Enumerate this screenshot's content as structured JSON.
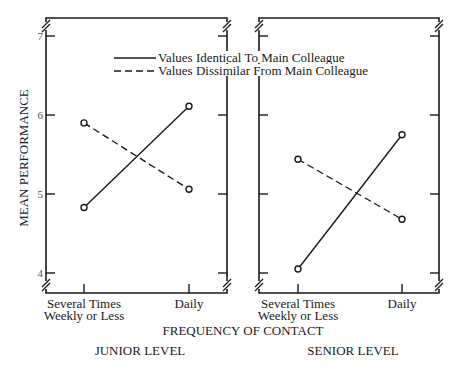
{
  "chart_data": {
    "type": "line",
    "ylabel": "MEAN PERFORMANCE",
    "xlabel": "FREQUENCY OF CONTACT",
    "ylim": [
      4,
      7
    ],
    "yticks": [
      4,
      5,
      6,
      7
    ],
    "categories": [
      "Several Times\nWeekly or Less",
      "Daily"
    ],
    "category_lines": [
      [
        "Several Times",
        "Weekly or Less"
      ],
      [
        "Daily"
      ]
    ],
    "legend": {
      "placement": "top-center",
      "entries": [
        {
          "name": "Values Identical To Main Colleague",
          "style": "solid"
        },
        {
          "name": "Values Dissimilar From Main Colleague",
          "style": "dashed"
        }
      ]
    },
    "panels": [
      {
        "title": "JUNIOR LEVEL",
        "series": [
          {
            "name": "Values Identical To Main Colleague",
            "style": "solid",
            "values": [
              4.83,
              6.11
            ]
          },
          {
            "name": "Values Dissimilar From Main Colleague",
            "style": "dashed",
            "values": [
              5.9,
              5.06
            ]
          }
        ]
      },
      {
        "title": "SENIOR LEVEL",
        "series": [
          {
            "name": "Values Identical To Main Colleague",
            "style": "solid",
            "values": [
              4.05,
              5.75
            ]
          },
          {
            "name": "Values Dissimilar From Main Colleague",
            "style": "dashed",
            "values": [
              5.44,
              4.68
            ]
          }
        ]
      }
    ]
  }
}
